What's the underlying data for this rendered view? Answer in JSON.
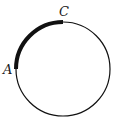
{
  "diagram": {
    "type": "circle-arc",
    "circle": {
      "cx": 63,
      "cy": 69,
      "r": 47,
      "stroke": "#111111"
    },
    "highlighted_arc": {
      "from": "A",
      "to": "C",
      "stroke_width": 4,
      "color": "#111111"
    },
    "points": [
      {
        "label": "A",
        "x": 16,
        "y": 69,
        "label_x": 3,
        "label_y": 74
      },
      {
        "label": "C",
        "x": 63,
        "y": 22,
        "label_x": 59,
        "label_y": 16
      }
    ]
  }
}
